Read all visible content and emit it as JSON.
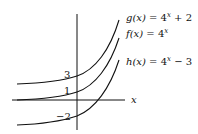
{
  "figure": {
    "axis_label_x": "x",
    "y_intercepts": [
      "3",
      "1",
      "−2"
    ],
    "functions": [
      {
        "id": "g",
        "name": "g(x)",
        "expr_base": "4",
        "exp": "x",
        "suffix": " + 2",
        "intercept": 3,
        "shift": 2
      },
      {
        "id": "f",
        "name": "f(x)",
        "expr_base": "4",
        "exp": "x",
        "suffix": "",
        "intercept": 1,
        "shift": 0
      },
      {
        "id": "h",
        "name": "h(x)",
        "expr_base": "4",
        "exp": "x",
        "suffix": " − 3",
        "intercept": -2,
        "shift": -3
      }
    ],
    "stroke_color": "#111111"
  }
}
